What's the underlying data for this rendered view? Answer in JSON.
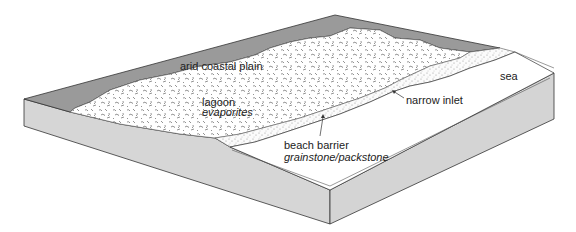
{
  "diagram": {
    "colors": {
      "coastal_plain": "#9a9a9a",
      "block_side": "#d6d6d6",
      "lagoon": "#ffffff",
      "sea": "#ffffff",
      "outline": "#333333",
      "text": "#222222"
    },
    "labels": {
      "coastal_plain": "arid coastal plain",
      "lagoon": "lagoon",
      "lagoon_facies": "evaporites",
      "inlet": "narrow inlet",
      "barrier": "beach barrier",
      "barrier_facies": "grainstone/packstone",
      "sea": "sea"
    }
  }
}
